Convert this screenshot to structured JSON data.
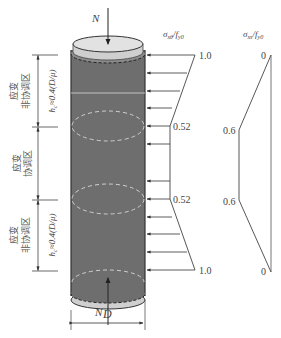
{
  "figure": {
    "load_top": "N",
    "load_bottom": "N",
    "diameter_label": "D",
    "hoop_axis_label": "σxθ/fy0",
    "axial_axis_label": "σxs/fy0",
    "zones": [
      {
        "name": "应变非协调区",
        "line1": "应变",
        "line2": "非协调区",
        "height_label": "hc≈0.4(D/μ)"
      },
      {
        "name": "应变协调区",
        "line1": "应变",
        "line2": "协调区"
      },
      {
        "name": "应变非协调区",
        "line1": "应变",
        "line2": "非协调区",
        "height_label": "hc≈0.4(D/μ)"
      }
    ],
    "hoop_profile": {
      "values": [
        "1.0",
        "0.52",
        "0.52",
        "1.0"
      ]
    },
    "axial_profile": {
      "values": [
        "0",
        "0.6",
        "0.6",
        "0"
      ]
    },
    "colors": {
      "column_body": "#6e6e6e",
      "cap": "#d9d9d9",
      "line": "#555555",
      "dash": "#c8c8c8"
    }
  }
}
